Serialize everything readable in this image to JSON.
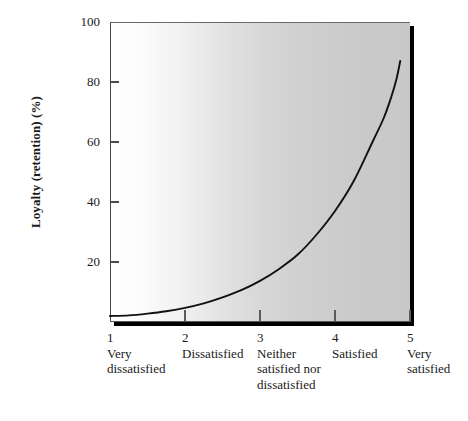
{
  "chart_data": {
    "type": "line",
    "title": "",
    "xlabel": "",
    "ylabel": "Loyalty (retention) (%)",
    "ylim": [
      0,
      100
    ],
    "xlim": [
      1,
      5
    ],
    "grid": false,
    "legend": null,
    "y_ticks": [
      {
        "value": 100,
        "label": "100"
      },
      {
        "value": 80,
        "label": "80"
      },
      {
        "value": 60,
        "label": "60"
      },
      {
        "value": 40,
        "label": "40"
      },
      {
        "value": 20,
        "label": "20"
      }
    ],
    "x_ticks": [
      {
        "value": 1,
        "number": "1",
        "label": "Very\ndissatisfied"
      },
      {
        "value": 2,
        "number": "2",
        "label": "Dissatisfied"
      },
      {
        "value": 3,
        "number": "3",
        "label": "Neither\nsatisfied nor\ndissatisfied"
      },
      {
        "value": 4,
        "number": "4",
        "label": "Satisfied"
      },
      {
        "value": 5,
        "number": "5",
        "label": "Very\nsatisfied"
      }
    ],
    "categories": [
      1,
      2,
      3,
      4,
      5
    ],
    "series": [
      {
        "name": "Loyalty curve",
        "x": [
          1.0,
          1.25,
          1.5,
          1.75,
          2.0,
          2.25,
          2.5,
          2.75,
          3.0,
          3.25,
          3.5,
          3.75,
          4.0,
          4.25,
          4.5,
          4.65,
          4.75,
          4.82,
          4.87
        ],
        "values": [
          2.0,
          2.2,
          2.8,
          3.6,
          4.7,
          6.2,
          8.2,
          10.6,
          13.7,
          17.6,
          22.4,
          29.0,
          37.0,
          47.0,
          60.0,
          68.0,
          75.0,
          81.0,
          87.0
        ],
        "color": "#111111"
      }
    ],
    "annotations": [],
    "plot_background": {
      "gradient_from": "#ffffff",
      "gradient_to": "#c8c8c8",
      "direction": "left-to-right"
    },
    "frame": {
      "shadow_color": "#000000",
      "axis_color": "#4a4a4a"
    }
  }
}
